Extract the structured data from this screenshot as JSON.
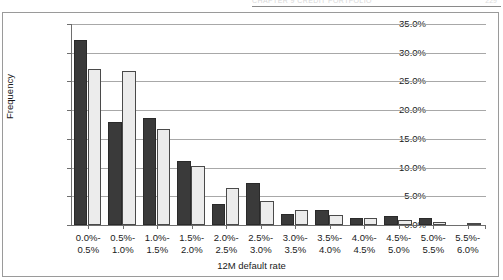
{
  "page_header": {
    "running_head": "CHAPTER 9  CREDIT PORTFOLIO",
    "folio": "229"
  },
  "chart_data": {
    "type": "bar",
    "title": "",
    "xlabel": "12M default rate",
    "ylabel": "Frequency",
    "ylim": [
      0,
      35
    ],
    "ytick_labels": [
      "0.0%",
      "5.0%",
      "10.0%",
      "15.0%",
      "20.0%",
      "25.0%",
      "30.0%",
      "35.0%"
    ],
    "ytick_values": [
      0,
      5,
      10,
      15,
      20,
      25,
      30,
      35
    ],
    "grid": true,
    "legend": "none",
    "categories": [
      "0.0%-\n0.5%",
      "0.5%-\n1.0%",
      "1.0%-\n1.5%",
      "1.5%-\n2.0%",
      "2.0%-\n2.5%",
      "2.5%-\n3.0%",
      "3.0%-\n3.5%",
      "3.5%-\n4.0%",
      "4.0%-\n4.5%",
      "4.5%-\n5.0%",
      "5.0%-\n5.5%",
      "5.5%-\n6.0%"
    ],
    "category_lines": [
      [
        "0.0%-",
        "0.5%"
      ],
      [
        "0.5%-",
        "1.0%"
      ],
      [
        "1.0%-",
        "1.5%"
      ],
      [
        "1.5%-",
        "2.0%"
      ],
      [
        "2.0%-",
        "2.5%"
      ],
      [
        "2.5%-",
        "3.0%"
      ],
      [
        "3.0%-",
        "3.5%"
      ],
      [
        "3.5%-",
        "4.0%"
      ],
      [
        "4.0%-",
        "4.5%"
      ],
      [
        "4.5%-",
        "5.0%"
      ],
      [
        "5.0%-",
        "5.5%"
      ],
      [
        "5.5%-",
        "6.0%"
      ]
    ],
    "series": [
      {
        "name": "series-1-dark",
        "color": "#3a3a3a",
        "values": [
          32.2,
          18.0,
          18.6,
          11.2,
          3.7,
          7.4,
          1.9,
          2.7,
          1.3,
          1.6,
          1.3,
          0.0
        ]
      },
      {
        "name": "series-2-light",
        "color": "#ececec",
        "values": [
          27.1,
          26.8,
          16.7,
          10.3,
          6.5,
          4.1,
          2.7,
          1.7,
          1.2,
          0.8,
          0.5,
          0.4
        ]
      }
    ]
  }
}
